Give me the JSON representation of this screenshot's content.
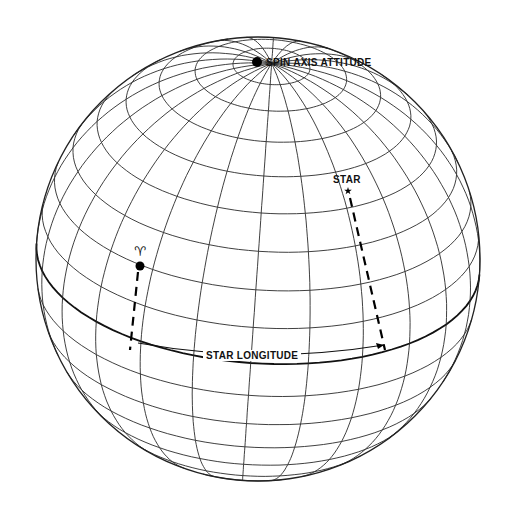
{
  "diagram": {
    "sphere": {
      "cx": 258,
      "cy": 259,
      "r": 222,
      "tilt_deg": 28,
      "rotation_deg": -4
    },
    "grid": {
      "lat_step_deg": 10,
      "lon_step_deg": 15,
      "line_color": "#2a2a2a",
      "equator_color": "#111111"
    },
    "labels": {
      "spin_axis": "SPIN AXIS ATTITUDE",
      "star": "STAR",
      "star_longitude": "STAR LONGITUDE",
      "vernal_equinox_symbol": "♈"
    },
    "points": {
      "spin_axis_pole": {
        "x": 257,
        "y": 62
      },
      "star": {
        "x": 348,
        "y": 191
      },
      "vernal_equinox": {
        "x": 140,
        "y": 266
      }
    },
    "star_meridian_dash": {
      "x1": 350,
      "y1": 198,
      "x2": 385,
      "y2": 350
    },
    "aries_meridian_dash": {
      "x1": 138,
      "y1": 272,
      "x2": 130,
      "y2": 350
    },
    "longitude_arrow": {
      "x1": 138,
      "y1": 343,
      "x2": 384,
      "y2": 345
    }
  }
}
